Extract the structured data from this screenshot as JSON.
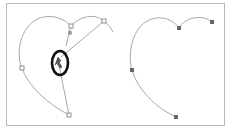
{
  "figure": {
    "panels": [
      {
        "name": "before",
        "path_color": "#a8a8a8",
        "anchor_style": "hollow",
        "anchors": [
          {
            "x": 71,
            "y": 26
          },
          {
            "x": 104,
            "y": 21
          },
          {
            "x": 22,
            "y": 68
          },
          {
            "x": 69,
            "y": 115
          }
        ],
        "handles": [
          {
            "x": 70,
            "y": 33
          }
        ],
        "cursor": {
          "x": 59,
          "y": 63,
          "highlight_ellipse": {
            "cx": 60,
            "cy": 63,
            "rx": 8,
            "ry": 12,
            "color": "#111111"
          }
        }
      },
      {
        "name": "after",
        "path_color": "#a8a8a8",
        "anchor_style": "filled",
        "anchors": [
          {
            "x": 179,
            "y": 28
          },
          {
            "x": 212,
            "y": 22
          },
          {
            "x": 132,
            "y": 70
          },
          {
            "x": 176,
            "y": 117
          }
        ]
      }
    ],
    "colors": {
      "frame_border": "#b8b8b8",
      "path": "#a8a8a8",
      "anchor_fill": "#666666",
      "anchor_hollow_stroke": "#777777",
      "highlight": "#111111"
    }
  }
}
